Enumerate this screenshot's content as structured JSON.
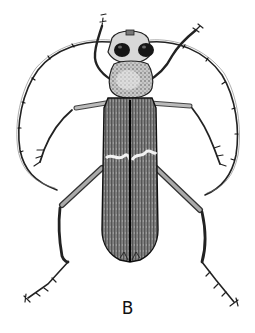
{
  "figure": {
    "style": "black and white pen illustration",
    "label": "B",
    "colors": {
      "background": "#ffffff",
      "ink": "#111111",
      "shade_dark": "#3a3a3a",
      "shade_mid": "#7a7a7a",
      "shade_light": "#d8d8d8"
    }
  }
}
